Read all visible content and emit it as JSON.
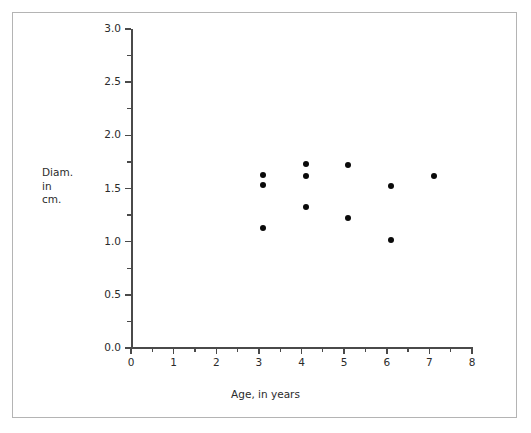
{
  "chart_data": {
    "type": "scatter",
    "title": "",
    "xlabel": "Age, in years",
    "ylabel": "Diam.\nin\ncm.",
    "ylabel_lines": [
      "Diam.",
      "in",
      "cm."
    ],
    "xlim": [
      0,
      8
    ],
    "ylim": [
      0.0,
      3.0
    ],
    "grid": false,
    "legend": null,
    "x_major_ticks": [
      0,
      1,
      2,
      3,
      4,
      5,
      6,
      7,
      8
    ],
    "x_tick_labels": [
      "0",
      "1",
      "2",
      "3",
      "4",
      "5",
      "6",
      "7",
      "8"
    ],
    "x_minor_ticks": [
      0.5,
      1.5,
      2.5,
      3.5,
      4.5,
      5.5,
      6.5,
      7.5
    ],
    "y_major_ticks": [
      0.0,
      0.5,
      1.0,
      1.5,
      2.0,
      2.5,
      3.0
    ],
    "y_tick_labels": [
      "0.0",
      "0.5",
      "1.0",
      "1.5",
      "2.0",
      "2.5",
      "3.0"
    ],
    "y_minor_ticks": [
      0.25,
      0.75,
      1.25,
      1.75,
      2.25,
      2.75
    ],
    "marker": "filled-circle",
    "marker_color": "#0a0a0a",
    "marker_size_px": 6,
    "axis_color": "#4a4a4a",
    "frame_color": "#b4b4b4",
    "background": "#ffffff",
    "points": [
      {
        "x": 3.1,
        "y": 1.63
      },
      {
        "x": 3.1,
        "y": 1.53
      },
      {
        "x": 3.1,
        "y": 1.13
      },
      {
        "x": 4.1,
        "y": 1.73
      },
      {
        "x": 4.1,
        "y": 1.62
      },
      {
        "x": 4.1,
        "y": 1.33
      },
      {
        "x": 5.1,
        "y": 1.72
      },
      {
        "x": 5.1,
        "y": 1.22
      },
      {
        "x": 6.1,
        "y": 1.52
      },
      {
        "x": 6.1,
        "y": 1.02
      },
      {
        "x": 7.1,
        "y": 1.62
      }
    ],
    "x": [
      3.1,
      3.1,
      3.1,
      4.1,
      4.1,
      4.1,
      5.1,
      5.1,
      6.1,
      6.1,
      7.1
    ],
    "values": [
      1.63,
      1.53,
      1.13,
      1.73,
      1.62,
      1.33,
      1.72,
      1.22,
      1.52,
      1.02,
      1.62
    ],
    "n_points": 11
  },
  "figure": {
    "width": 531,
    "height": 433
  }
}
